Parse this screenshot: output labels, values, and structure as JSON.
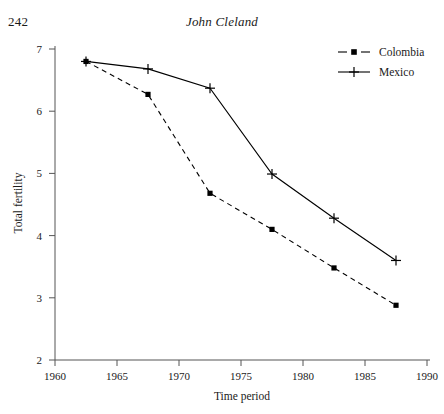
{
  "page": {
    "folio": "242",
    "running_head": "John Cleland"
  },
  "chart_data": {
    "type": "line",
    "title": "",
    "xlabel": "Time period",
    "ylabel": "Total fertility",
    "xlim": [
      1960,
      1990
    ],
    "ylim": [
      2,
      7
    ],
    "xticks": [
      1960,
      1965,
      1970,
      1975,
      1980,
      1985,
      1990
    ],
    "xtick_labels": [
      "1960",
      "1965",
      "1970",
      "1975",
      "1980",
      "1985",
      "1990"
    ],
    "yticks": [
      2,
      3,
      4,
      5,
      6,
      7
    ],
    "ytick_labels": [
      "2",
      "3",
      "4",
      "5",
      "6",
      "7"
    ],
    "grid": false,
    "legend_position": "top-right",
    "x": [
      1962.5,
      1967.5,
      1972.5,
      1977.5,
      1982.5,
      1987.5
    ],
    "series": [
      {
        "name": "Colombia",
        "marker": "square",
        "line": "dashed",
        "color": "#000000",
        "values": [
          6.8,
          6.27,
          4.68,
          4.1,
          3.48,
          2.88
        ]
      },
      {
        "name": "Mexico",
        "marker": "plus",
        "line": "solid",
        "color": "#000000",
        "values": [
          6.8,
          6.68,
          6.37,
          4.99,
          4.28,
          3.6
        ]
      }
    ]
  },
  "legend": {
    "items": [
      {
        "label": "Colombia"
      },
      {
        "label": "Mexico"
      }
    ]
  },
  "colors": {
    "ink": "#1a1a1a",
    "axis": "#555555",
    "background": "#ffffff"
  }
}
